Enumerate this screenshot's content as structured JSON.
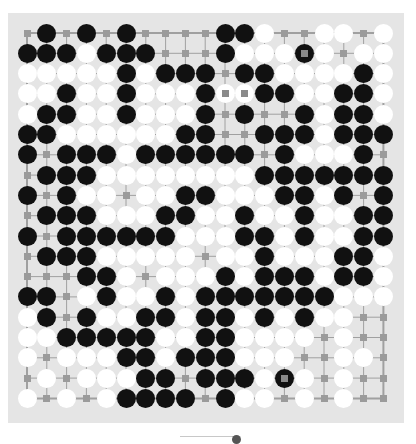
{
  "board": {
    "size": 19,
    "background": "#e5e5e5",
    "line_color": "#a0a0a0",
    "black": "#111111",
    "white": "#ffffff",
    "rows": [
      ". B . B . B . . . . B B W . . W W . W",
      "B B B W B B B . . . B W W W b W . W W",
      "W W W W W B W B B B . B B W W W W B W",
      "W W B W W B W W W B w w B B W W B B W",
      "W B B W W B W W W B . B . . B W B B W",
      "B B W W W W W W B B . . B B B W B B B",
      "B . B B B W B B B B B B . B W W W B .",
      ". B B B W W W W W W W W B B B B B B B",
      "B . B W W . W W B B W W W B B W B . B",
      ". B B B W W W B B W W B W W B W W B B",
      "B . B B B B B B W W W B B W B W W B B",
      ". B B B W W W W W . W W B W W W B B W",
      ". . . B B W . W W W B W B B B W B B W",
      "B B . W B W W B W B B B B B B B W W W",
      "W B . B W W B B W B B W B W B W W . .",
      "W W B B B B B W W B B W W W W . W . .",
      "W . W W W B B W B B B W W W . . W W .",
      ". W . W W W B B . B B B W b W . W . .",
      "W . W . W B B B B . B W W . W . W . ."
    ],
    "legend": {
      "B": "black stone",
      "W": "white stone",
      "b": "marked black stone (last move)",
      "w": "marked white stone",
      ".": "empty point (marked)"
    }
  }
}
